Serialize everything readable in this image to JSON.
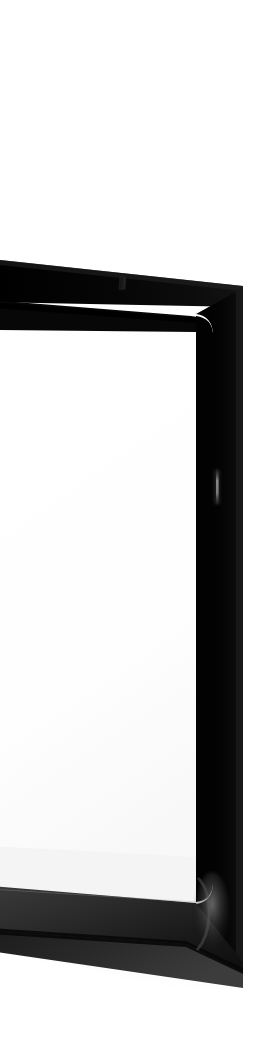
{
  "image": {
    "subject": "glossy black display bezel",
    "scene_description": "Close, steeply angled photograph of the right-hand portion of a glossy black monitor or display frame standing on a white surface against a plain white background.",
    "background_color": "#ffffff",
    "orientation": "portrait",
    "width_px": 257,
    "height_px": 1063,
    "lighting": "bright, diffuse, high-key; blown-out white background",
    "capture_angle": "steep oblique / near edge-on from the left side"
  },
  "palette": {
    "background": "#ffffff",
    "bezel_black": "#060606",
    "bezel_black_deep": "#000000",
    "bezel_edge_gray": "#2b2b2b",
    "bezel_edge_gray_light": "#4a4a4a",
    "screen_white": "#fdfdfd",
    "screen_panel_gray": "#f2f2f2",
    "specular_highlight": "#9a9a9a",
    "shadow_soft": "#d8d8d8"
  },
  "regions": [
    {
      "name": "upper-white-field",
      "label": "Empty white background (upper)",
      "y_range_px": [
        0,
        255
      ],
      "color": "#ffffff",
      "note": "Completely blank, blown-out white; no detail."
    },
    {
      "name": "top-bezel-bar",
      "label": "Top bezel bar",
      "y_range_px": [
        258,
        300
      ],
      "color": "#060606",
      "note": "Near-black bar sloping down-to-the-right, running off the left edge of the frame."
    },
    {
      "name": "top-bezel-inner-bar",
      "label": "Top bezel inner edge bar",
      "y_range_px": [
        292,
        330
      ],
      "color": "#0a0a0a",
      "note": "Second, thinner dark bar below the first, converging toward the left; the two bars form the V of the receding top edge."
    },
    {
      "name": "screen-face",
      "label": "Screen face / inner panel",
      "y_range_px": [
        300,
        905
      ],
      "color": "#fdfdfd",
      "note": "Large white interior of the display with softly rounded corners at the right."
    },
    {
      "name": "right-bezel-column",
      "label": "Right bezel column",
      "x_range_px": [
        196,
        241
      ],
      "color": "#050505",
      "note": "Vertical glossy black side of the frame, widening slightly toward the bottom."
    },
    {
      "name": "bottom-bezel",
      "label": "Bottom bezel / base edge",
      "y_range_px": [
        880,
        1005
      ],
      "color": "#1f1f1f",
      "note": "Wedge-shaped dark base sloping down to the right, with a lighter gray top facet catching the light."
    },
    {
      "name": "panel-texture-strip",
      "label": "Pixel-grid texture strip",
      "y_range_px": [
        893,
        955
      ],
      "color": "#f2f2f2",
      "note": "Narrow band of the panel seen nearly edge-on, showing a faint vertical pixel/subpixel striping."
    },
    {
      "name": "lower-white-field",
      "label": "Empty white background (lower)",
      "y_range_px": [
        1005,
        1063
      ],
      "color": "#ffffff",
      "note": "Blank white below the object."
    }
  ],
  "details": [
    {
      "name": "sensor-mark",
      "label": "Small sensor / camera mark on top bezel",
      "position_px": [
        122,
        281
      ],
      "size_px": [
        7,
        14
      ],
      "color": "#151515",
      "note": "Faint slightly-lighter smudge in the top bar, reading as a camera or sensor cut-out."
    },
    {
      "name": "specular-streak",
      "label": "Vertical specular highlight on right bezel",
      "position_px": [
        217,
        478
      ],
      "size_px": [
        3,
        40
      ],
      "color": "#8e8e8e",
      "note": "Thin bright reflection running down the glossy side panel."
    },
    {
      "name": "corner-highlight",
      "label": "Glossy highlight at bottom-right corner",
      "position_px": [
        205,
        895
      ],
      "size_px": [
        22,
        60
      ],
      "color": "#6a6a6a",
      "note": "Soft curved sheen wrapping the rounded bottom-right corner."
    },
    {
      "name": "corner-radius-top-right",
      "label": "Rounded top-right inner corner",
      "position_px": [
        196,
        312
      ],
      "radius_px": 16
    },
    {
      "name": "corner-radius-bottom-right",
      "label": "Rounded bottom-right inner corner",
      "position_px": [
        196,
        890
      ],
      "radius_px": 18
    }
  ],
  "geometry": {
    "top_bar_outer": "(0,262) → (241,288) → (241,304) → (0,300)",
    "top_bar_inner": "(0,303) → (196,318) → (196,332) → (0,330)",
    "right_column": "(196,312) → (241,292) → (241,962) → (196,905)",
    "bottom_wedge": "(0,888) → (196,905) → (241,962) → (241,985) → (0,935)",
    "screen_quad": "(0,303) → (196,318) → (196,900) → (0,890)",
    "vanishing_direction": "toward the left edge of the frame"
  },
  "accessibility": {
    "alt_text": "A steeply angled close-up photograph of the glossy black bezel of a computer display, its white screen face filling the left side, set against a plain white background."
  }
}
